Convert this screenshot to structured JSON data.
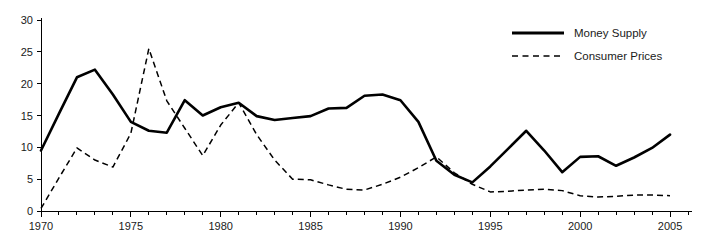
{
  "chart_data": {
    "type": "line",
    "title": "",
    "subtitle": "",
    "xlabel": "",
    "ylabel": "",
    "xlim": [
      1970,
      2006
    ],
    "ylim": [
      0,
      30
    ],
    "grid": false,
    "legend_position": "top-right",
    "x_major_ticks": [
      1970,
      1975,
      1980,
      1985,
      1990,
      1995,
      2000,
      2005
    ],
    "x_tick_labels": [
      "1970",
      "1975",
      "1980",
      "1985",
      "1990",
      "1995",
      "2000",
      "2005"
    ],
    "x_minor_tick_interval": 1,
    "y_ticks": [
      0,
      5,
      10,
      15,
      20,
      25,
      30
    ],
    "y_tick_labels": [
      "0",
      "5",
      "10",
      "15",
      "20",
      "25",
      "30"
    ],
    "x": [
      1970,
      1971,
      1972,
      1973,
      1974,
      1975,
      1976,
      1977,
      1978,
      1979,
      1980,
      1981,
      1982,
      1983,
      1984,
      1985,
      1986,
      1987,
      1988,
      1989,
      1990,
      1991,
      1992,
      1993,
      1994,
      1995,
      1996,
      1997,
      1998,
      1999,
      2000,
      2001,
      2002,
      2003,
      2004,
      2005
    ],
    "series": [
      {
        "name": "Money Supply",
        "style": "solid",
        "color": "#000000",
        "values": [
          9.5,
          15.3,
          21.0,
          22.2,
          18.3,
          14.0,
          12.6,
          12.3,
          17.4,
          15.0,
          16.3,
          17.0,
          14.9,
          14.3,
          14.6,
          14.9,
          16.1,
          16.2,
          18.1,
          18.3,
          17.4,
          14.0,
          7.9,
          5.7,
          4.5,
          7.0,
          9.8,
          12.6,
          9.5,
          6.1,
          8.5,
          8.6,
          7.1,
          8.4,
          9.9,
          12.0
        ]
      },
      {
        "name": "Consumer Prices",
        "style": "dashed",
        "color": "#000000",
        "values": [
          0.4,
          5.2,
          9.9,
          8.0,
          6.9,
          12.2,
          25.5,
          17.3,
          13.0,
          8.7,
          13.5,
          17.0,
          12.0,
          8.0,
          5.0,
          4.9,
          4.1,
          3.4,
          3.3,
          4.2,
          5.3,
          6.8,
          8.5,
          6.0,
          4.2,
          3.0,
          3.1,
          3.3,
          3.4,
          3.2,
          2.4,
          2.2,
          2.3,
          2.5,
          2.5,
          2.4
        ]
      }
    ]
  },
  "legend": {
    "entries": [
      {
        "label": "Money Supply",
        "style": "solid"
      },
      {
        "label": "Consumer Prices",
        "style": "dashed"
      }
    ]
  }
}
